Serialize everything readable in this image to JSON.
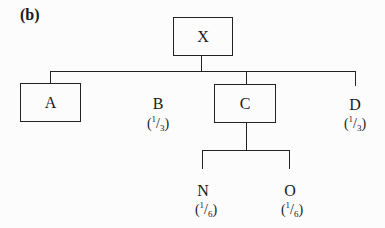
{
  "figure_label": "(b)",
  "root": {
    "label": "X"
  },
  "children": [
    {
      "id": "A",
      "label": "A",
      "boxed": true,
      "share": ""
    },
    {
      "id": "B",
      "label": "B",
      "boxed": false,
      "share": {
        "num": "1",
        "den": "3"
      }
    },
    {
      "id": "C",
      "label": "C",
      "boxed": true,
      "share": ""
    },
    {
      "id": "D",
      "label": "D",
      "boxed": false,
      "share": {
        "num": "1",
        "den": "3"
      }
    }
  ],
  "grandchildren": [
    {
      "id": "N",
      "parent": "C",
      "label": "N",
      "share": {
        "num": "1",
        "den": "6"
      }
    },
    {
      "id": "O",
      "parent": "C",
      "label": "O",
      "share": {
        "num": "1",
        "den": "6"
      }
    }
  ],
  "colors": {
    "line": "#222222",
    "background": "#fcfcfc"
  }
}
